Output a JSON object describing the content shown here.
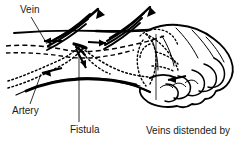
{
  "figure": {
    "title_alt": "Arteriovenous fistula in forearm and hand",
    "ink_color": "#000000",
    "background_color": "#ffffff",
    "text_color": "#1a1a1a",
    "width": 243,
    "height": 147
  },
  "labels": {
    "vein": "Vein",
    "artery": "Artery",
    "fistula": "Fistula",
    "distended_line1": "Veins distended by",
    "distended_line2": "arterial blood",
    "distended_line3": "circulation"
  },
  "anatomy": {
    "vessel_styles": {
      "vein": "dashed",
      "artery": "dotted"
    },
    "parts": [
      "forearm-outline",
      "hand-outline",
      "curled-fingers",
      "vein-dashed-path",
      "artery-dotted-path",
      "fistula-junction",
      "hand-vein-network"
    ],
    "flow_arrows": [
      "vein-flow-arrow-left",
      "vein-flow-arrow-right",
      "artery-flow-arrow-left",
      "artery-flow-arrow-fistula",
      "hand-vein-arrow"
    ],
    "distension_arrow_groups": 2
  }
}
